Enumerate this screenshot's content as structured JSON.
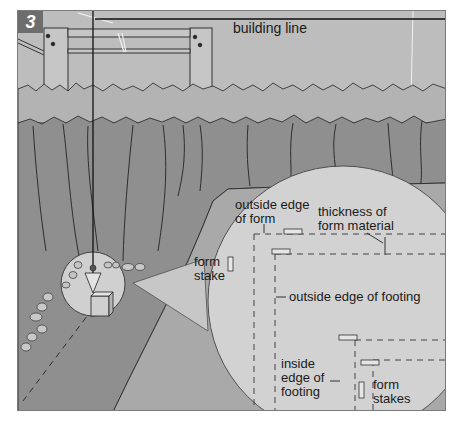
{
  "figure": {
    "step_number": "3",
    "colors": {
      "sky": "#bdbdbd",
      "grass_band": "#b3b3b3",
      "trench_wall": "#8f8f8f",
      "trench_floor": "#a9a9a9",
      "magnifier": "#d2d2d2",
      "line": "#1a1a1a"
    },
    "labels": {
      "building_line": "building line",
      "outside_edge_of_form": "outside edge\nof form",
      "thickness_of_form_material": "thickness of\nform material",
      "form_stake": "form\nstake",
      "outside_edge_of_footing": "outside edge of footing",
      "inside_edge_of_footing": "inside\nedge of\nfooting",
      "form_stakes": "form\nstakes"
    }
  }
}
